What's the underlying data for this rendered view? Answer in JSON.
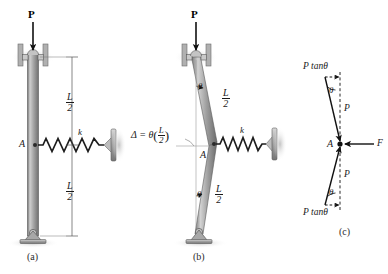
{
  "figure": {
    "background_color": "#ffffff",
    "ink_color": "#1a1a1a",
    "member_color": "#9a9a9a",
    "support_color": "#8c8c8c"
  },
  "panels": [
    {
      "id": "a",
      "tag": "(a)",
      "labels": {
        "load": "P",
        "point_a": "A",
        "spring_constant": "k",
        "dim_upper_num": "L",
        "dim_upper_den": "2",
        "dim_lower_num": "L",
        "dim_lower_den": "2"
      }
    },
    {
      "id": "b",
      "tag": "(b)",
      "labels": {
        "load": "P",
        "point_a": "A",
        "spring_constant": "k",
        "theta_upper": "θ",
        "theta_lower": "θ",
        "len_upper_num": "L",
        "len_upper_den": "2",
        "len_lower_num": "L",
        "len_lower_den": "2",
        "deflection_prefix": "Δ = θ",
        "deflection_frac_num": "L",
        "deflection_frac_den": "2"
      }
    },
    {
      "id": "c",
      "tag": "(c)",
      "labels": {
        "point_a": "A",
        "force_top_horizontal": "P tanθ",
        "force_top_vertical": "P",
        "force_bottom_horizontal": "P tanθ",
        "force_bottom_vertical": "P",
        "spring_force": "F",
        "theta_top": "θ",
        "theta_bottom": "θ"
      }
    }
  ]
}
